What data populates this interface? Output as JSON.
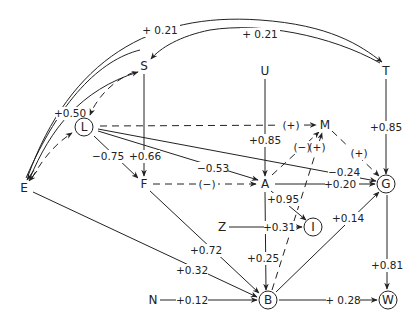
{
  "diagram": {
    "type": "path-diagram",
    "nodes": [
      {
        "id": "S",
        "label": "S",
        "x": 144,
        "y": 66,
        "circled": false
      },
      {
        "id": "U",
        "label": "U",
        "x": 265,
        "y": 71,
        "circled": false
      },
      {
        "id": "T",
        "label": "T",
        "x": 386,
        "y": 71,
        "circled": false
      },
      {
        "id": "L",
        "label": "L",
        "x": 84,
        "y": 127,
        "circled": true
      },
      {
        "id": "M",
        "label": "M",
        "x": 325,
        "y": 125,
        "circled": false
      },
      {
        "id": "E",
        "label": "E",
        "x": 24,
        "y": 188,
        "circled": false
      },
      {
        "id": "F",
        "label": "F",
        "x": 144,
        "y": 184,
        "circled": false
      },
      {
        "id": "A",
        "label": "A",
        "x": 265,
        "y": 184,
        "circled": false
      },
      {
        "id": "G",
        "label": "G",
        "x": 386,
        "y": 184,
        "circled": true
      },
      {
        "id": "Z",
        "label": "Z",
        "x": 222,
        "y": 227,
        "circled": false
      },
      {
        "id": "I",
        "label": "I",
        "x": 313,
        "y": 227,
        "circled": true
      },
      {
        "id": "N",
        "label": "N",
        "x": 153,
        "y": 300,
        "circled": false
      },
      {
        "id": "B",
        "label": "B",
        "x": 268,
        "y": 300,
        "circled": true
      },
      {
        "id": "W",
        "label": "W",
        "x": 388,
        "y": 300,
        "circled": true
      }
    ],
    "edges": [
      {
        "from": "E",
        "to": "T",
        "label": "+0.21",
        "style": "solid"
      },
      {
        "from": "T",
        "to": "S",
        "label": "+0.21",
        "style": "solid"
      },
      {
        "from": "T",
        "to": "E",
        "label": "",
        "style": "solid"
      },
      {
        "from": "E",
        "to": "S",
        "label": "+0.50",
        "style": "solid"
      },
      {
        "from": "S",
        "to": "L",
        "label": "",
        "style": "dashed"
      },
      {
        "from": "E",
        "to": "L",
        "label": "",
        "style": "dashed"
      },
      {
        "from": "L",
        "to": "E",
        "label": "",
        "style": "dashed"
      },
      {
        "from": "S",
        "to": "F",
        "label": "+0.66",
        "style": "solid"
      },
      {
        "from": "L",
        "to": "F",
        "label": "-0.75",
        "style": "solid"
      },
      {
        "from": "L",
        "to": "A",
        "label": "-0.53",
        "style": "solid"
      },
      {
        "from": "L",
        "to": "G",
        "label": "-0.24",
        "style": "solid"
      },
      {
        "from": "L",
        "to": "M",
        "label": "(+)",
        "style": "dashed"
      },
      {
        "from": "U",
        "to": "A",
        "label": "+0.85",
        "style": "solid"
      },
      {
        "from": "T",
        "to": "G",
        "label": "+0.85",
        "style": "solid"
      },
      {
        "from": "F",
        "to": "A",
        "label": "(-)",
        "style": "dashed"
      },
      {
        "from": "A",
        "to": "M",
        "label": "(-)",
        "style": "dashed"
      },
      {
        "from": "B",
        "to": "M",
        "label": "(+)",
        "style": "dashed"
      },
      {
        "from": "M",
        "to": "G",
        "label": "(+)",
        "style": "dashed"
      },
      {
        "from": "A",
        "to": "G",
        "label": "+0.20",
        "style": "solid"
      },
      {
        "from": "A",
        "to": "I",
        "label": "+0.95",
        "style": "solid"
      },
      {
        "from": "Z",
        "to": "I",
        "label": "+0.31",
        "style": "solid"
      },
      {
        "from": "A",
        "to": "B",
        "label": "+0.25",
        "style": "solid"
      },
      {
        "from": "F",
        "to": "B",
        "label": "+0.72",
        "style": "solid"
      },
      {
        "from": "E",
        "to": "B",
        "label": "+0.32",
        "style": "solid"
      },
      {
        "from": "N",
        "to": "B",
        "label": "+0.12",
        "style": "solid"
      },
      {
        "from": "B",
        "to": "G",
        "label": "+0.14",
        "style": "solid"
      },
      {
        "from": "G",
        "to": "W",
        "label": "+0.81",
        "style": "solid"
      },
      {
        "from": "B",
        "to": "W",
        "label": "+0.28",
        "style": "solid"
      }
    ],
    "edge_labels": {
      "e_t": "+ 0.21",
      "t_s": "+ 0.21",
      "e_s": "+0.50",
      "s_f": "+0.66",
      "l_f": "−0.75",
      "l_a": "−0.53",
      "l_g": "−0.24",
      "l_m": "(+)",
      "u_a": "+0.85",
      "t_g": "+0.85",
      "f_a": "(−)",
      "a_m": "(−)",
      "b_m": "(+)",
      "m_g": "(+)",
      "a_g": "+0.20",
      "a_i": "+0.95",
      "z_i": "+0.31",
      "a_b": "+0.25",
      "f_b": "+0.72",
      "e_b": "+0.32",
      "n_b": "+0.12",
      "b_g": "+0.14",
      "g_w": "+0.81",
      "b_w": "+ 0.28"
    },
    "node_labels": {
      "S": "S",
      "U": "U",
      "T": "T",
      "L": "L",
      "M": "M",
      "E": "E",
      "F": "F",
      "A": "A",
      "G": "G",
      "Z": "Z",
      "I": "I",
      "N": "N",
      "B": "B",
      "W": "W"
    }
  }
}
